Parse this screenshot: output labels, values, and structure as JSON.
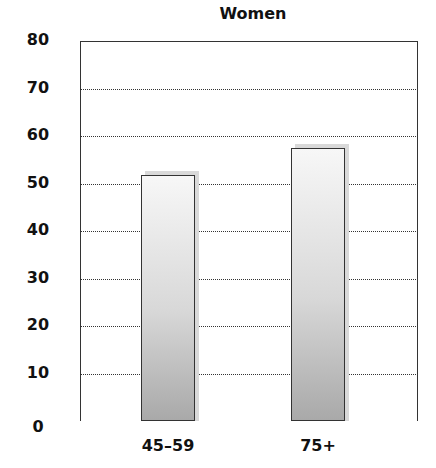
{
  "chart_data": {
    "type": "bar",
    "title": "Women",
    "categories": [
      "45–59",
      "75+"
    ],
    "values": [
      51.7,
      57.4
    ],
    "xlabel": "",
    "ylabel": "",
    "ylim": [
      0,
      80
    ],
    "yticks": [
      "0",
      "10",
      "20",
      "30",
      "40",
      "50",
      "60",
      "70",
      "80"
    ],
    "grid": "horizontal dotted",
    "legend": null
  }
}
